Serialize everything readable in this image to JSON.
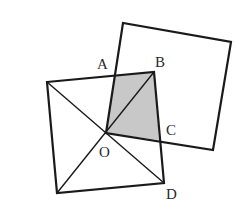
{
  "diagram": {
    "colors": {
      "stroke": "#1a1a1a",
      "shade": "#c8c8c8",
      "label": "#2a2a2a"
    },
    "left_square": {
      "vertices": [
        [
          47,
          82
        ],
        [
          154,
          72
        ],
        [
          164,
          183
        ],
        [
          57,
          193
        ]
      ],
      "diagonals": [
        [
          [
            47,
            82
          ],
          [
            164,
            183
          ]
        ],
        [
          [
            154,
            72
          ],
          [
            57,
            193
          ]
        ]
      ]
    },
    "right_square": {
      "vertices": [
        [
          106,
          133
        ],
        [
          123,
          23
        ],
        [
          231,
          42
        ],
        [
          213,
          150
        ]
      ]
    },
    "shaded_region": {
      "vertices": [
        [
          106,
          133
        ],
        [
          115,
          76
        ],
        [
          154,
          72
        ],
        [
          159,
          140
        ]
      ],
      "name": "quadrilateral OABC"
    },
    "labels": [
      {
        "text": "A",
        "x": 97,
        "y": 69
      },
      {
        "text": "B",
        "x": 155,
        "y": 67
      },
      {
        "text": "C",
        "x": 166,
        "y": 135
      },
      {
        "text": "O",
        "x": 99,
        "y": 157
      },
      {
        "text": "D",
        "x": 166,
        "y": 199
      }
    ]
  }
}
